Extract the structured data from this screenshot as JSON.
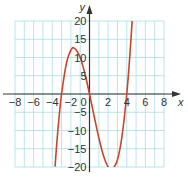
{
  "chart_data": {
    "type": "line",
    "title": "",
    "xlabel": "x",
    "ylabel": "y",
    "xlim": [
      -8,
      8
    ],
    "ylim": [
      -20,
      20
    ],
    "grid": true,
    "x_ticks": [
      -8,
      -6,
      -4,
      -2,
      0,
      2,
      4,
      6,
      8
    ],
    "x_tick_labels": [
      "−8",
      "−6",
      "−4",
      "−2",
      "0",
      "2",
      "4",
      "6",
      "8"
    ],
    "y_ticks": [
      20,
      15,
      10,
      5,
      -5,
      -10,
      -15,
      -20
    ],
    "y_tick_labels": [
      "20",
      "15",
      "10",
      "5",
      "−5",
      "−10",
      "−15",
      "−20"
    ],
    "series": [
      {
        "name": "cubic curve",
        "color": "#c8452c",
        "x": [
          -3.7,
          -3.5,
          -3.25,
          -3,
          -2.5,
          -2,
          -1.6,
          -1,
          -0.5,
          0,
          0.5,
          1,
          1.5,
          2,
          2.4,
          3,
          3.5,
          4,
          4.3,
          4.58
        ],
        "y": [
          -19.9,
          -13.1,
          -5.9,
          0,
          8.1,
          12,
          12.5,
          10,
          5.6,
          0,
          -6.1,
          -12,
          -16.9,
          -20,
          -20.7,
          -18,
          -11.4,
          0,
          9.4,
          20
        ]
      }
    ],
    "grid_color": "#a9dde6",
    "axis_color": "#333333"
  }
}
